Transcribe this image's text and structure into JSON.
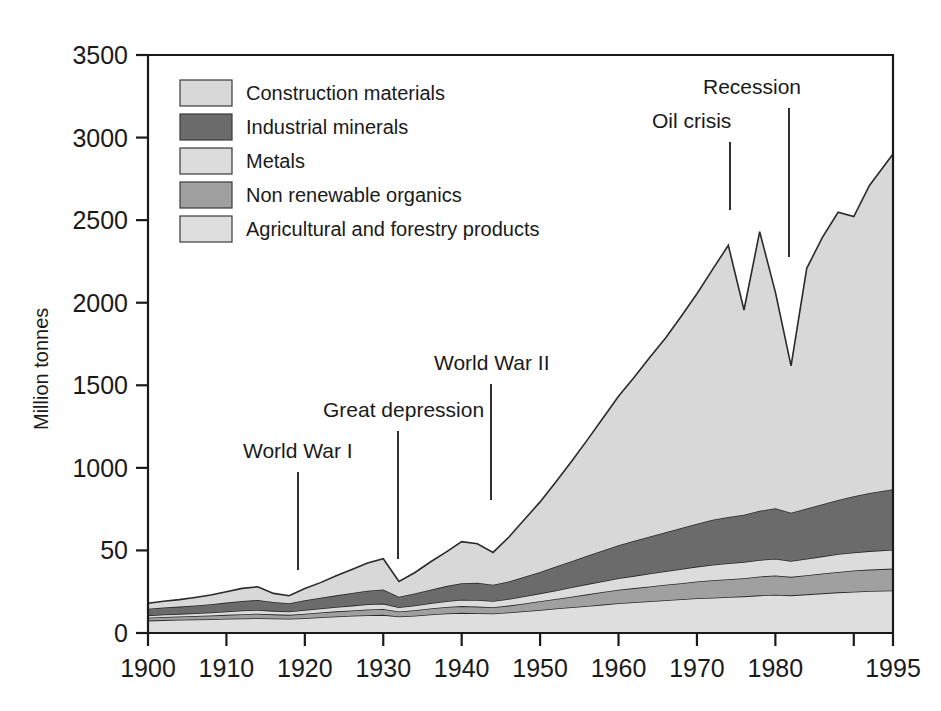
{
  "chart_data": {
    "type": "area",
    "stacked": true,
    "title": "",
    "xlabel": "",
    "ylabel": "Million tonnes",
    "xlim": [
      1900,
      1995
    ],
    "ylim": [
      0,
      3500
    ],
    "grid": false,
    "legend_position": "top-left",
    "ytick_labels": [
      "0",
      "50",
      "1000",
      "1500",
      "2000",
      "2500",
      "3000",
      "3500"
    ],
    "ytick_values": [
      0,
      500,
      1000,
      1500,
      2000,
      2500,
      3000,
      3500
    ],
    "xtick_labels": [
      "1900",
      "1910",
      "1920",
      "1930",
      "1940",
      "1950",
      "1960",
      "1970",
      "1980",
      "",
      "1995"
    ],
    "xtick_values": [
      1900,
      1910,
      1920,
      1930,
      1940,
      1950,
      1960,
      1970,
      1980,
      1990,
      1995
    ],
    "x": [
      1900,
      1902,
      1904,
      1906,
      1908,
      1910,
      1912,
      1914,
      1916,
      1918,
      1920,
      1922,
      1924,
      1926,
      1928,
      1930,
      1932,
      1934,
      1936,
      1938,
      1940,
      1942,
      1944,
      1946,
      1948,
      1950,
      1952,
      1954,
      1956,
      1958,
      1960,
      1962,
      1964,
      1966,
      1968,
      1970,
      1972,
      1974,
      1976,
      1978,
      1980,
      1982,
      1984,
      1986,
      1988,
      1990,
      1992,
      1995
    ],
    "series": [
      {
        "name": "Agricultural and forestry products",
        "color": "#dedede",
        "values": [
          75,
          78,
          80,
          82,
          84,
          86,
          88,
          90,
          88,
          86,
          90,
          95,
          100,
          104,
          108,
          110,
          100,
          105,
          112,
          118,
          122,
          120,
          118,
          124,
          132,
          140,
          148,
          156,
          164,
          172,
          180,
          186,
          192,
          198,
          204,
          210,
          214,
          218,
          222,
          228,
          232,
          228,
          234,
          240,
          246,
          250,
          254,
          258
        ]
      },
      {
        "name": "Non renewable organics",
        "color": "#a0a0a0",
        "values": [
          18,
          19,
          20,
          21,
          22,
          24,
          26,
          27,
          25,
          24,
          27,
          29,
          31,
          33,
          35,
          36,
          30,
          33,
          36,
          39,
          41,
          40,
          38,
          42,
          47,
          52,
          58,
          64,
          70,
          76,
          82,
          86,
          90,
          94,
          98,
          102,
          106,
          108,
          110,
          114,
          116,
          112,
          116,
          120,
          124,
          128,
          130,
          132
        ]
      },
      {
        "name": "Metals",
        "color": "#dcdcdc",
        "values": [
          14,
          15,
          16,
          17,
          18,
          20,
          22,
          23,
          21,
          20,
          23,
          25,
          27,
          29,
          31,
          32,
          26,
          29,
          32,
          35,
          38,
          40,
          38,
          40,
          44,
          48,
          52,
          57,
          62,
          66,
          70,
          74,
          78,
          82,
          86,
          90,
          94,
          96,
          98,
          100,
          102,
          96,
          100,
          104,
          108,
          110,
          112,
          114
        ]
      },
      {
        "name": "Industrial minerals",
        "color": "#6b6b6b",
        "values": [
          40,
          42,
          44,
          47,
          50,
          54,
          58,
          60,
          54,
          50,
          58,
          64,
          70,
          76,
          82,
          86,
          64,
          72,
          82,
          92,
          100,
          104,
          98,
          106,
          118,
          130,
          144,
          158,
          172,
          186,
          200,
          212,
          224,
          236,
          248,
          260,
          272,
          280,
          286,
          298,
          306,
          292,
          304,
          316,
          328,
          340,
          352,
          366
        ]
      },
      {
        "name": "Construction materials",
        "color": "#d8d8d8",
        "values": [
          33,
          38,
          42,
          48,
          56,
          66,
          76,
          80,
          52,
          46,
          72,
          92,
          118,
          142,
          168,
          186,
          92,
          126,
          168,
          206,
          252,
          236,
          196,
          268,
          346,
          424,
          512,
          604,
          700,
          800,
          902,
          990,
          1086,
          1176,
          1282,
          1392,
          1516,
          1646,
          1240,
          1690,
          1308,
          890,
          1454,
          1616,
          1742,
          1694,
          1862,
          2030
        ]
      }
    ],
    "annotations": [
      {
        "label": "World War I",
        "year": 1918,
        "label_x": 243,
        "label_y": 458,
        "line_x": 298,
        "line_y1": 472,
        "line_y2": 570
      },
      {
        "label": "Great depression",
        "year": 1932,
        "label_x": 323,
        "label_y": 417,
        "line_x": 398,
        "line_y1": 431,
        "line_y2": 559
      },
      {
        "label": "World War II",
        "year": 1944,
        "label_x": 434,
        "label_y": 370,
        "line_x": 491,
        "line_y1": 384,
        "line_y2": 500
      },
      {
        "label": "Oil crisis",
        "year": 1974,
        "label_x": 652,
        "label_y": 128,
        "line_x": 730,
        "line_y1": 142,
        "line_y2": 210
      },
      {
        "label": "Recession",
        "year": 1982,
        "label_x": 703,
        "label_y": 94,
        "line_x": 789,
        "line_y1": 108,
        "line_y2": 257
      }
    ]
  },
  "legend": {
    "items": [
      {
        "label": "Construction materials",
        "color": "#d8d8d8"
      },
      {
        "label": "Industrial minerals",
        "color": "#6b6b6b"
      },
      {
        "label": "Metals",
        "color": "#dcdcdc"
      },
      {
        "label": "Non renewable organics",
        "color": "#a0a0a0"
      },
      {
        "label": "Agricultural and forestry products",
        "color": "#dedede"
      }
    ]
  }
}
